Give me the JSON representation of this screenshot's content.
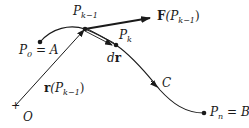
{
  "diagram": {
    "type": "line-integral-curve",
    "colors": {
      "stroke": "#1a1a1a",
      "background": "#ffffff"
    },
    "labels": {
      "p_k_minus_1": {
        "main": "P",
        "sub": "k−1"
      },
      "p_k": {
        "main": "P",
        "sub": "k"
      },
      "p0": {
        "main": "P",
        "sub": "0",
        "rest": " = A"
      },
      "pn": {
        "main": "P",
        "sub": "n",
        "rest": " = B"
      },
      "force": {
        "bold": "F",
        "open": "(P",
        "sub": "k−1",
        "close": ")"
      },
      "dr": {
        "d": "d",
        "r": "r"
      },
      "position": {
        "bold": "r",
        "open": "(P",
        "sub": "k−1",
        "close": ")"
      },
      "curve": "C",
      "origin": "O",
      "origin_mark": "+"
    }
  }
}
